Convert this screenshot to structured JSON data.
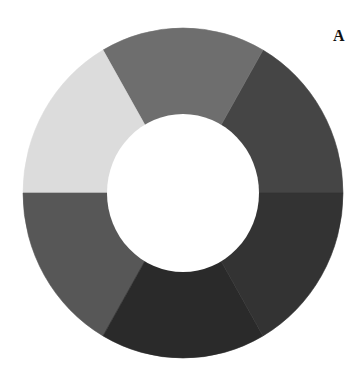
{
  "panel": {
    "label": "A"
  },
  "geometry": {
    "cx": 183,
    "cy": 193,
    "outer_rx": 160,
    "outer_ry": 165,
    "inner_rx": 76,
    "inner_ry": 79,
    "background": "#ffffff",
    "hole_color": "#ffffff"
  },
  "chart_data": {
    "type": "pie",
    "variant": "donut",
    "title": "",
    "panel_label": "A",
    "legend": "none",
    "categories": [
      "Segment 1",
      "Segment 2",
      "Segment 3",
      "Segment 4",
      "Segment 5",
      "Segment 6"
    ],
    "values": [
      16.67,
      16.67,
      16.67,
      16.67,
      16.67,
      16.67
    ],
    "segments": [
      {
        "start_deg": 0,
        "end_deg": 60,
        "color": "#454545"
      },
      {
        "start_deg": 60,
        "end_deg": 120,
        "color": "#6e6e6e"
      },
      {
        "start_deg": 120,
        "end_deg": 180,
        "color": "#dcdcdc"
      },
      {
        "start_deg": 180,
        "end_deg": 240,
        "color": "#575757"
      },
      {
        "start_deg": 240,
        "end_deg": 300,
        "color": "#2a2a2a"
      },
      {
        "start_deg": 300,
        "end_deg": 360,
        "color": "#333333"
      }
    ],
    "angle_convention": "degrees counter-clockwise from 3 o'clock"
  }
}
